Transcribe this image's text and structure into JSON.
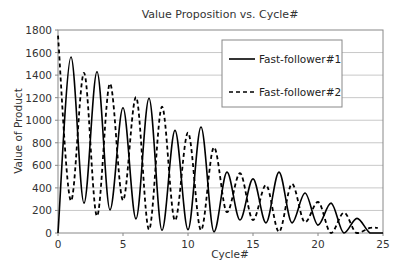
{
  "chart_data": {
    "type": "line",
    "title": "Value Proposition vs. Cycle#",
    "xlabel": "Cycle#",
    "ylabel": "Value of Product",
    "xlim": [
      0,
      25
    ],
    "ylim": [
      0,
      1800
    ],
    "x_ticks": [
      0,
      5,
      10,
      15,
      20,
      25
    ],
    "y_ticks": [
      0,
      200,
      400,
      600,
      800,
      1000,
      1200,
      1400,
      1600,
      1800
    ],
    "grid": {
      "horizontal": true,
      "vertical": false
    },
    "legend_position": "upper right (inside plot)",
    "series": [
      {
        "name": "Fast-follower#1",
        "style": "solid",
        "color": "#000000",
        "x": [
          0,
          1,
          2,
          3,
          4,
          5,
          6,
          7,
          8,
          9,
          10,
          11,
          12,
          13,
          14,
          15,
          16,
          17,
          18,
          19,
          20,
          21,
          22,
          23,
          24,
          25
        ],
        "values": [
          0,
          1560,
          265,
          1430,
          205,
          1110,
          125,
          1195,
          25,
          910,
          30,
          940,
          10,
          540,
          115,
          480,
          90,
          540,
          90,
          355,
          70,
          265,
          0,
          130,
          0,
          0
        ]
      },
      {
        "name": "Fast-follower#2",
        "style": "dashed",
        "color": "#000000",
        "x": [
          0,
          1,
          2,
          3,
          4,
          5,
          6,
          7,
          8,
          9,
          10,
          11,
          12,
          13,
          14,
          15,
          16,
          17,
          18,
          19,
          20,
          21,
          22,
          23,
          24,
          24.6
        ],
        "values": [
          1750,
          285,
          1420,
          150,
          1325,
          290,
          1205,
          30,
          1120,
          110,
          890,
          25,
          760,
          185,
          530,
          115,
          425,
          10,
          435,
          95,
          275,
          0,
          180,
          0,
          45,
          45
        ]
      }
    ]
  }
}
